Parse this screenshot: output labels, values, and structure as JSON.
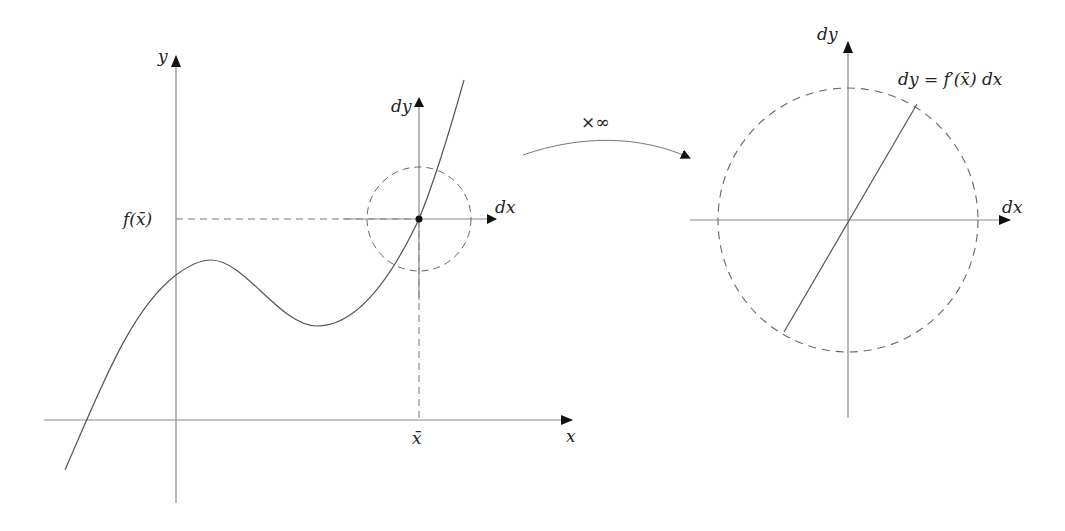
{
  "left_plot": {
    "y_axis_label": "y",
    "x_axis_label": "x",
    "fx_label": "f(x̄)",
    "xbar_label": "x̄",
    "local_dy_label": "dy",
    "local_dx_label": "dx"
  },
  "arrow": {
    "label": "×∞"
  },
  "right_plot": {
    "dy_label": "dy",
    "dx_label": "dx",
    "equation": "dy = f′(x̄) dx"
  },
  "colors": {
    "axis": "#8a8a8a",
    "curve": "#555555",
    "dashed": "#666666",
    "arrowhead": "#111111",
    "text": "#222222"
  }
}
